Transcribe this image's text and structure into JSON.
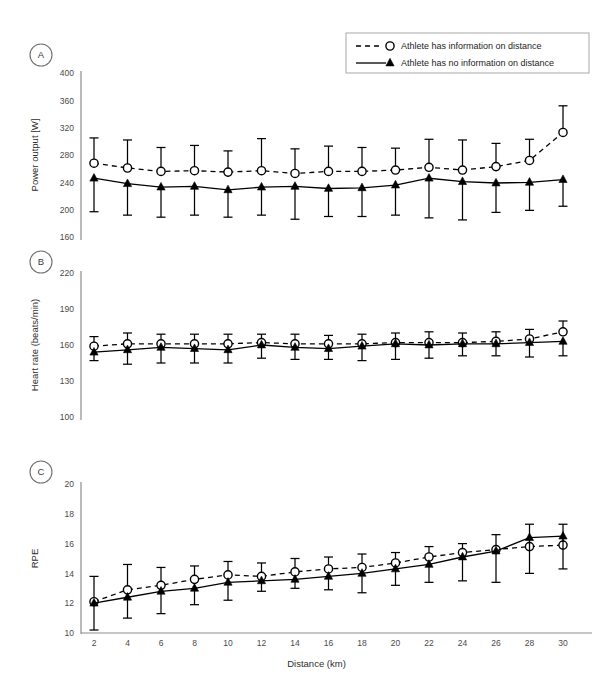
{
  "figure": {
    "legend": {
      "entries": [
        {
          "label": "Athlete has information on distance",
          "marker": "open-circle-icon",
          "line": "dashed"
        },
        {
          "label": "Athlete has no information on distance",
          "marker": "filled-triangle-icon",
          "line": "solid"
        }
      ]
    },
    "xaxis_title": "Distance (km)",
    "panels": [
      {
        "letter": "A",
        "ylabel": "Power output [W]"
      },
      {
        "letter": "B",
        "ylabel": "Heart rate (beats/min)"
      },
      {
        "letter": "C",
        "ylabel": "RPE"
      }
    ]
  },
  "chart_data": [
    {
      "id": "panel-a",
      "type": "line",
      "panel": "A",
      "title": "",
      "xlabel": "Distance (km)",
      "ylabel": "Power output [W]",
      "xlim": [
        0,
        32
      ],
      "ylim": [
        160,
        400
      ],
      "yticks": [
        160,
        200,
        240,
        280,
        320,
        360,
        400
      ],
      "xticks": [
        2,
        4,
        6,
        8,
        10,
        12,
        14,
        16,
        18,
        20,
        22,
        24,
        26,
        28,
        30
      ],
      "grid": false,
      "legend_position": "top-right",
      "x": [
        2,
        4,
        6,
        8,
        10,
        12,
        14,
        16,
        18,
        20,
        22,
        24,
        26,
        28,
        30
      ],
      "series": [
        {
          "name": "Athlete has information on distance",
          "marker": "open-circle",
          "line": "dashed",
          "values": [
            268,
            261,
            256,
            257,
            255,
            257,
            253,
            256,
            256,
            258,
            262,
            258,
            263,
            272,
            313
          ],
          "err_upper": [
            305,
            302,
            291,
            294,
            286,
            304,
            289,
            293,
            291,
            290,
            303,
            302,
            297,
            303,
            352
          ],
          "err_lower": [
            268,
            261,
            256,
            257,
            255,
            257,
            253,
            256,
            256,
            258,
            262,
            258,
            263,
            272,
            313
          ]
        },
        {
          "name": "Athlete has no information on distance",
          "marker": "filled-triangle",
          "line": "solid",
          "values": [
            246,
            238,
            233,
            234,
            229,
            233,
            234,
            231,
            232,
            236,
            246,
            241,
            239,
            240,
            244
          ],
          "err_upper": [
            246,
            238,
            233,
            234,
            229,
            233,
            234,
            231,
            232,
            236,
            246,
            241,
            239,
            240,
            244
          ],
          "err_lower": [
            197,
            192,
            189,
            192,
            189,
            192,
            186,
            190,
            190,
            192,
            188,
            185,
            196,
            199,
            205
          ]
        }
      ]
    },
    {
      "id": "panel-b",
      "type": "line",
      "panel": "B",
      "title": "",
      "xlabel": "Distance (km)",
      "ylabel": "Heart rate (beats/min)",
      "xlim": [
        0,
        32
      ],
      "ylim": [
        100,
        220
      ],
      "yticks": [
        100,
        130,
        160,
        190,
        220
      ],
      "xticks": [
        2,
        4,
        6,
        8,
        10,
        12,
        14,
        16,
        18,
        20,
        22,
        24,
        26,
        28,
        30
      ],
      "grid": false,
      "legend_position": "none",
      "x": [
        2,
        4,
        6,
        8,
        10,
        12,
        14,
        16,
        18,
        20,
        22,
        24,
        26,
        28,
        30
      ],
      "series": [
        {
          "name": "Athlete has information on distance",
          "marker": "open-circle",
          "line": "dashed",
          "values": [
            159,
            161,
            161,
            161,
            161,
            162,
            161,
            161,
            161,
            162,
            162,
            162,
            163,
            165,
            171
          ],
          "err_upper": [
            167,
            170,
            169,
            169,
            169,
            169,
            169,
            168,
            169,
            170,
            171,
            170,
            171,
            173,
            180
          ],
          "err_lower": [
            159,
            161,
            161,
            161,
            161,
            162,
            161,
            161,
            161,
            162,
            162,
            162,
            163,
            165,
            171
          ]
        },
        {
          "name": "Athlete has no information on distance",
          "marker": "filled-triangle",
          "line": "solid",
          "values": [
            154,
            156,
            158,
            157,
            156,
            160,
            158,
            157,
            159,
            161,
            160,
            161,
            161,
            162,
            163
          ],
          "err_upper": [
            154,
            156,
            158,
            157,
            156,
            160,
            158,
            157,
            159,
            161,
            160,
            161,
            161,
            162,
            163
          ],
          "err_lower": [
            147,
            144,
            145,
            145,
            145,
            149,
            148,
            148,
            147,
            148,
            149,
            151,
            151,
            150,
            151
          ]
        }
      ]
    },
    {
      "id": "panel-c",
      "type": "line",
      "panel": "C",
      "title": "",
      "xlabel": "Distance (km)",
      "ylabel": "RPE",
      "xlim": [
        0,
        32
      ],
      "ylim": [
        10,
        20
      ],
      "yticks": [
        10,
        12,
        14,
        16,
        18,
        20
      ],
      "xticks": [
        2,
        4,
        6,
        8,
        10,
        12,
        14,
        16,
        18,
        20,
        22,
        24,
        26,
        28,
        30
      ],
      "grid": false,
      "legend_position": "none",
      "x": [
        2,
        4,
        6,
        8,
        10,
        12,
        14,
        16,
        18,
        20,
        22,
        24,
        26,
        28,
        30
      ],
      "series": [
        {
          "name": "Athlete has information on distance",
          "marker": "open-circle",
          "line": "dashed",
          "values": [
            12.1,
            12.9,
            13.2,
            13.6,
            13.9,
            13.8,
            14.1,
            14.3,
            14.4,
            14.7,
            15.1,
            15.4,
            15.6,
            15.8,
            15.9
          ],
          "err_upper": [
            13.8,
            14.6,
            14.4,
            14.5,
            14.8,
            14.7,
            15.0,
            15.1,
            15.3,
            15.4,
            15.8,
            16.0,
            16.6,
            17.3,
            17.3
          ],
          "err_lower": [
            12.1,
            12.9,
            13.2,
            13.6,
            13.9,
            13.8,
            14.1,
            14.3,
            14.4,
            14.7,
            15.1,
            15.4,
            15.6,
            15.8,
            15.9
          ]
        },
        {
          "name": "Athlete has no information on distance",
          "marker": "filled-triangle",
          "line": "solid",
          "values": [
            12.0,
            12.4,
            12.8,
            13.0,
            13.4,
            13.5,
            13.6,
            13.8,
            14.0,
            14.3,
            14.6,
            15.1,
            15.5,
            16.4,
            16.5
          ],
          "err_upper": [
            12.0,
            12.4,
            12.8,
            13.0,
            13.4,
            13.5,
            13.6,
            13.8,
            14.0,
            14.3,
            14.6,
            15.1,
            15.5,
            16.4,
            16.5
          ],
          "err_lower": [
            10.2,
            11.0,
            11.3,
            11.9,
            12.2,
            12.8,
            13.0,
            12.9,
            12.7,
            13.2,
            13.4,
            13.5,
            13.4,
            14.0,
            14.3
          ]
        }
      ]
    }
  ]
}
